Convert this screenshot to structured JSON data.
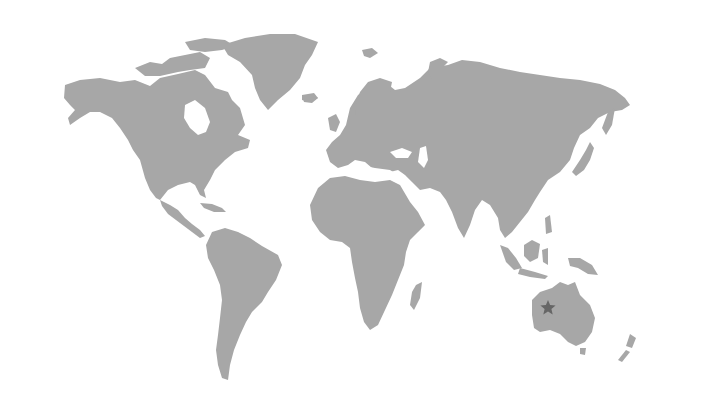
{
  "map": {
    "type": "world-map",
    "projection": "miller-like",
    "background_color": "#ffffff",
    "land_color": "#a7a7a7",
    "marker": {
      "icon": "star-icon",
      "region": "Western Australia",
      "x": 548,
      "y": 308,
      "color": "#666666"
    }
  }
}
